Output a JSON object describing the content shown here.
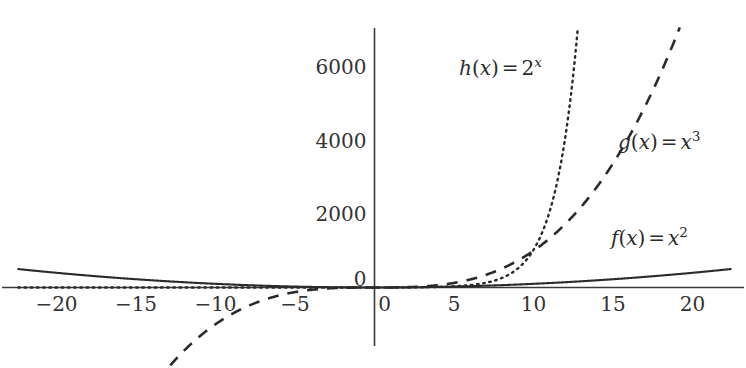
{
  "figure": {
    "background_color": "#ffffff",
    "line_color": "#2b2b2b",
    "axis_color": "#3a3a3a",
    "width": 746,
    "height": 368
  },
  "chart_data": {
    "type": "line",
    "title": "",
    "xlabel": "",
    "ylabel": "",
    "xlim": [
      -22.4,
      23.4
    ],
    "ylim": [
      -3600,
      7050
    ],
    "grid": false,
    "legend_position": "inline-annotations",
    "x_ticks": [
      -20,
      -15,
      -10,
      -5,
      0,
      5,
      10,
      15,
      20
    ],
    "x_tick_labels": [
      "−20",
      "−15",
      "−10",
      "−5",
      "0",
      "5",
      "10",
      "15",
      "20"
    ],
    "y_ticks": [
      0,
      2000,
      4000,
      6000
    ],
    "y_tick_labels": [
      "0",
      "2000",
      "4000",
      "6000"
    ],
    "series": [
      {
        "name": "f",
        "label_text": "f(x) = x²",
        "label_fn": "f",
        "label_arg": "x",
        "label_eq": "=",
        "label_base": "x",
        "label_exp": "2",
        "formula": "x^2",
        "style": "solid",
        "color": "#2b2b2b",
        "x": [
          -22.4,
          -20,
          -17.5,
          -15,
          -12.5,
          -10,
          -7.5,
          -5,
          -2.5,
          0,
          2.5,
          5,
          7.5,
          10,
          12.5,
          15,
          17.5,
          20,
          22.4
        ],
        "values": [
          501.8,
          400,
          306.3,
          225,
          156.3,
          100,
          56.3,
          25,
          6.3,
          0,
          6.3,
          25,
          56.3,
          100,
          156.3,
          225,
          306.3,
          400,
          501.8
        ]
      },
      {
        "name": "g",
        "label_text": "g(x) = x³",
        "label_fn": "g",
        "label_arg": "x",
        "label_eq": "=",
        "label_base": "x",
        "label_exp": "3",
        "formula": "x^3",
        "style": "dashed",
        "color": "#2b2b2b",
        "x": [
          -15.3,
          -14,
          -12,
          -10,
          -8,
          -6,
          -4,
          -2,
          0,
          2,
          4,
          6,
          8,
          10,
          12,
          14,
          16,
          18,
          19.2
        ],
        "values": [
          -3581,
          -2744,
          -1728,
          -1000,
          -512,
          -216,
          -64,
          -8,
          0,
          8,
          64,
          216,
          512,
          1000,
          1728,
          2744,
          4096,
          5832,
          7078
        ]
      },
      {
        "name": "h",
        "label_text": "h(x) = 2ˣ",
        "label_fn": "h",
        "label_arg": "x",
        "label_eq": "=",
        "label_base": "2",
        "label_exp": "x",
        "formula": "2^x",
        "style": "dotted",
        "color": "#2b2b2b",
        "x": [
          -22.4,
          -20,
          -15,
          -10,
          -5,
          0,
          2,
          4,
          6,
          8,
          9,
          10,
          11,
          12,
          12.79
        ],
        "values": [
          0,
          0,
          0,
          0.001,
          0.031,
          1,
          4,
          16,
          64,
          256,
          512,
          1024,
          2048,
          4096,
          7078
        ]
      }
    ],
    "annotations": [
      {
        "text": "h(x) = 2^x",
        "series": "h",
        "x_px": 459,
        "y_px": 58
      },
      {
        "text": "g(x) = x^3",
        "series": "g",
        "x_px": 618,
        "y_px": 132
      },
      {
        "text": "f(x) = x^2",
        "series": "f",
        "x_px": 611,
        "y_px": 228
      }
    ]
  }
}
